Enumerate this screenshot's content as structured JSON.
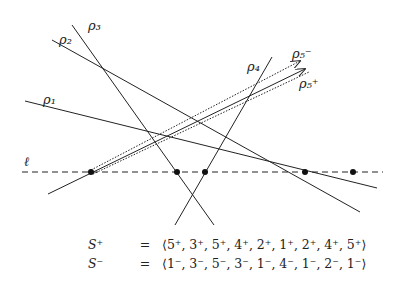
{
  "figure": {
    "line_labels": {
      "rho1": "ρ₁",
      "rho2": "ρ₂",
      "rho3": "ρ₃",
      "rho4": "ρ₄",
      "rho5_minus": "ρ₅⁻",
      "rho5_plus": "ρ₅⁺",
      "ell": "ℓ"
    },
    "sweep_line": {
      "y": 172,
      "x1": 22,
      "x2": 383,
      "style": "dashed"
    },
    "intersection_points_on_ell": [
      91,
      177,
      205,
      305,
      353
    ],
    "colors": {
      "stroke": "#222222",
      "background": "#ffffff"
    }
  },
  "sequences": {
    "s_plus": {
      "lhs": "S⁺",
      "eq": "=",
      "rhs": "⟨5⁺, 3⁺, 5⁺, 4⁺, 2⁺, 1⁺, 2⁺, 4⁺, 5⁺⟩"
    },
    "s_minus": {
      "lhs": "S⁻",
      "eq": "=",
      "rhs": "⟨1⁻, 3⁻, 5⁻, 3⁻, 1⁻, 4⁻, 1⁻, 2⁻, 1⁻⟩"
    }
  }
}
